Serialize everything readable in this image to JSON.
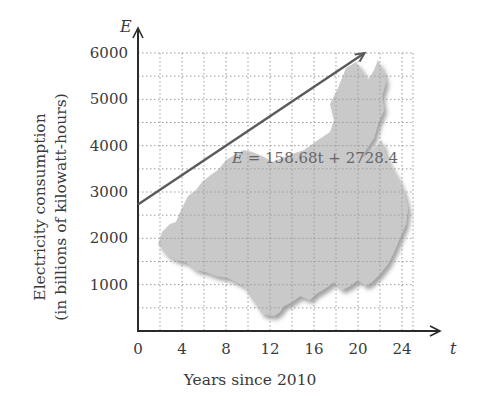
{
  "chart_data": {
    "type": "line",
    "title": "",
    "xlabel": "Years since 2010",
    "ylabel_line1": "Electricity consumption",
    "ylabel_line2": "(in billions of kilowatt-hours)",
    "x_var": "t",
    "y_var": "E",
    "xlim": [
      0,
      25
    ],
    "ylim": [
      0,
      6000
    ],
    "x_ticks": [
      0,
      4,
      8,
      12,
      16,
      20,
      24
    ],
    "y_ticks": [
      1000,
      2000,
      3000,
      4000,
      5000,
      6000
    ],
    "grid": true,
    "grid_x_step": 2,
    "grid_y_step": 500,
    "series": [
      {
        "name": "E = 158.68t + 2728.4",
        "slope": 158.68,
        "intercept": 2728.4,
        "x": [
          0,
          20.6
        ],
        "values": [
          2728.4,
          6000
        ]
      }
    ],
    "annotation": "E = 158.68t + 2728.4",
    "background_image": "map of China (gray silhouette)",
    "colors": {
      "line": "#5a5a5a",
      "map": "#c8c8c8",
      "grid": "#9a9a9a",
      "axis": "#2a2a2a"
    }
  }
}
